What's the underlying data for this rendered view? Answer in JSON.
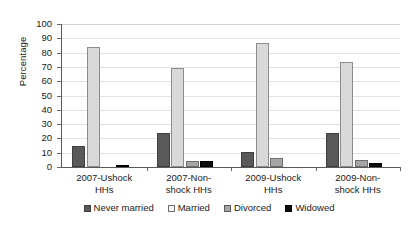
{
  "chart_data": {
    "type": "bar",
    "title": "",
    "xlabel": "",
    "ylabel": "Percentage",
    "ylim": [
      0,
      100
    ],
    "ytick_step": 10,
    "yticks": [
      0,
      10,
      20,
      30,
      40,
      50,
      60,
      70,
      80,
      90,
      100
    ],
    "grid": true,
    "legend_position": "bottom",
    "categories": [
      "2007-Ushock HHs",
      "2007-Non-shock HHs",
      "2009-Ushock HHs",
      "2009-Non-shock HHs"
    ],
    "category_lines": [
      [
        "2007-Ushock",
        "HHs"
      ],
      [
        "2007-Non-",
        "shock HHs"
      ],
      [
        "2009-Ushock",
        "HHs"
      ],
      [
        "2009-Non-",
        "shock HHs"
      ]
    ],
    "series": [
      {
        "name": "Never married",
        "color": "#595959",
        "values": [
          15,
          24,
          10.5,
          23.5
        ]
      },
      {
        "name": "Married",
        "color": "#d9d9d9",
        "values": [
          84,
          69,
          86.5,
          73.5
        ]
      },
      {
        "name": "Divorced",
        "color": "#a6a6a6",
        "values": [
          0,
          4.5,
          6,
          5
        ]
      },
      {
        "name": "Widowed",
        "color": "#0d0d0d",
        "values": [
          1.5,
          4,
          0,
          2.5
        ]
      }
    ]
  },
  "axis": {
    "y_title": "Percentage"
  },
  "legend": {
    "items": [
      {
        "label": "Never married"
      },
      {
        "label": "Married"
      },
      {
        "label": "Divorced"
      },
      {
        "label": "Widowed"
      }
    ]
  }
}
